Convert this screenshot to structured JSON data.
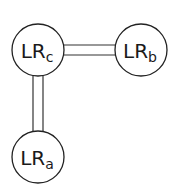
{
  "diagram": {
    "nodes": [
      {
        "id": "c",
        "main": "LR",
        "sub": "c",
        "cx": 38,
        "cy": 50,
        "r": 26
      },
      {
        "id": "b",
        "main": "LR",
        "sub": "b",
        "cx": 141,
        "cy": 50,
        "r": 26
      },
      {
        "id": "a",
        "main": "LR",
        "sub": "a",
        "cx": 38,
        "cy": 157,
        "r": 26
      }
    ],
    "edges": [
      {
        "from": "c",
        "to": "b",
        "style": "double"
      },
      {
        "from": "c",
        "to": "a",
        "style": "double"
      }
    ],
    "colors": {
      "stroke": "#222222",
      "fill": "#ffffff",
      "text": "#1a1a1a"
    }
  }
}
